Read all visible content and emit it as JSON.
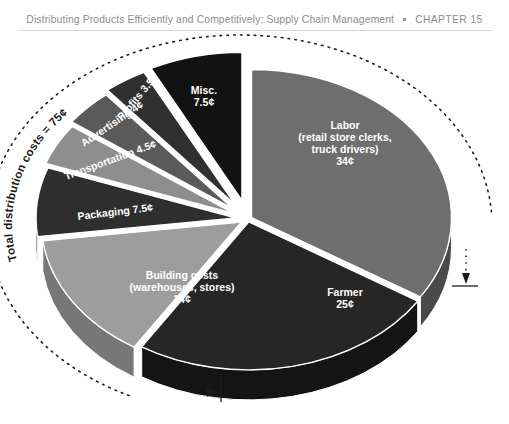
{
  "running_head": {
    "title": "Distributing Products Efficiently and Competitively: Supply Chain Management",
    "separator": "•",
    "chapter": "CHAPTER 15"
  },
  "figure": {
    "annotation": "Total distribution costs = 75¢",
    "annotation_arc_note": "dotted arc spanning the distribution-cost slices with arrowheads at both ends"
  },
  "chart_data": {
    "type": "pie",
    "title": "",
    "subtitle": "",
    "style": "3d-exploded",
    "unit": "¢",
    "total": 100,
    "categories": [
      "Labor (retail store clerks, truck drivers)",
      "Farmer",
      "Building costs (warehouses, stores)",
      "Packaging",
      "Transportation",
      "Advertising",
      "Profits",
      "Misc."
    ],
    "values": [
      34,
      25,
      14,
      7.5,
      4.5,
      4,
      3.5,
      7.5
    ],
    "slices": [
      {
        "name": "labor",
        "label_lines": [
          "Labor",
          "(retail store clerks,",
          "truck drivers)",
          "34¢"
        ],
        "value": 34,
        "value_text": "34¢",
        "color": "#6e6e6e",
        "side_color": "#4a4a4a",
        "label_placement": "inside",
        "label_rotation": 0
      },
      {
        "name": "farmer",
        "label_lines": [
          "Farmer",
          "25¢"
        ],
        "value": 25,
        "value_text": "25¢",
        "color": "#262626",
        "side_color": "#141414",
        "label_placement": "inside",
        "label_rotation": 0
      },
      {
        "name": "building-costs",
        "label_lines": [
          "Building costs",
          "(warehouses, stores)",
          "14¢"
        ],
        "value": 14,
        "value_text": "14¢",
        "color": "#9d9d9d",
        "side_color": "#777777",
        "label_placement": "inside",
        "label_rotation": 0
      },
      {
        "name": "packaging",
        "label_lines": [
          "Packaging 7.5¢"
        ],
        "value": 7.5,
        "value_text": "7.5¢",
        "color": "#2e2e2e",
        "side_color": "#1a1a1a",
        "label_placement": "inside",
        "label_rotation": -8
      },
      {
        "name": "transportation",
        "label_lines": [
          "Transportation 4.5¢"
        ],
        "value": 4.5,
        "value_text": "4.5¢",
        "color": "#8e8e8e",
        "side_color": "#6b6b6b",
        "label_placement": "inside",
        "label_rotation": -22
      },
      {
        "name": "advertising",
        "label_lines": [
          "Advertising 4¢"
        ],
        "value": 4,
        "value_text": "4¢",
        "color": "#5a5a5a",
        "side_color": "#3d3d3d",
        "label_placement": "inside",
        "label_rotation": -36
      },
      {
        "name": "profits",
        "label_lines": [
          "Profits 3.5¢"
        ],
        "value": 3.5,
        "value_text": "3.5¢",
        "color": "#303030",
        "side_color": "#1d1d1d",
        "label_placement": "inside",
        "label_rotation": -52
      },
      {
        "name": "misc",
        "label_lines": [
          "Misc.",
          "7.5¢"
        ],
        "value": 7.5,
        "value_text": "7.5¢",
        "color": "#121212",
        "side_color": "#080808",
        "label_placement": "inside",
        "label_rotation": 0
      }
    ],
    "annotations": [
      {
        "name": "total-distribution-costs",
        "text": "Total distribution costs = 75¢",
        "placement": "arc-outside-left"
      }
    ],
    "legend": "none",
    "grid": false
  }
}
